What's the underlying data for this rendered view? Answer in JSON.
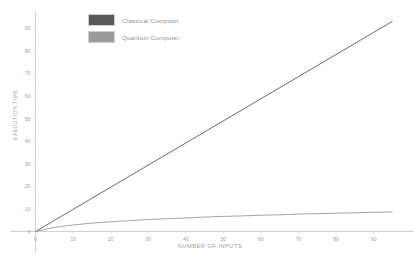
{
  "chart_data": {
    "type": "line",
    "title": "",
    "subtitle": "",
    "xlabel": "NUMBER OF INPUTS",
    "ylabel": "EXECUTION TIME",
    "xlim": [
      0,
      97
    ],
    "ylim": [
      0,
      95
    ],
    "xticks": [
      0,
      10,
      20,
      30,
      40,
      50,
      60,
      70,
      80,
      90
    ],
    "yticks": [
      0,
      10,
      20,
      30,
      40,
      50,
      60,
      70,
      80,
      90
    ],
    "grid": false,
    "legend_position": "top-left-inside",
    "series": [
      {
        "name": "Classical Computer",
        "color": "#595959",
        "x": [
          0,
          5,
          10,
          15,
          20,
          25,
          30,
          35,
          40,
          45,
          50,
          55,
          60,
          65,
          70,
          75,
          80,
          85,
          90,
          95
        ],
        "values": [
          0,
          4.9,
          9.8,
          14.7,
          19.6,
          24.5,
          29.4,
          34.3,
          39.2,
          44.1,
          49,
          53.9,
          58.8,
          63.7,
          68.6,
          73.5,
          78.4,
          83.3,
          88.2,
          93.1
        ]
      },
      {
        "name": "Quantum Computer",
        "color": "#9b9b9b",
        "x": [
          0,
          5,
          10,
          15,
          20,
          25,
          30,
          35,
          40,
          45,
          50,
          55,
          60,
          65,
          70,
          75,
          80,
          85,
          90,
          95
        ],
        "values": [
          0,
          1.8,
          2.9,
          3.7,
          4.3,
          4.8,
          5.3,
          5.7,
          6.0,
          6.4,
          6.7,
          6.9,
          7.2,
          7.4,
          7.7,
          7.9,
          8.1,
          8.3,
          8.5,
          8.7
        ]
      }
    ]
  },
  "legend": {
    "entries": [
      {
        "label": "Classical Computer",
        "color": "#595959"
      },
      {
        "label": "Quantum Computer",
        "color": "#9b9b9b"
      }
    ]
  },
  "axes": {
    "x_title": "NUMBER OF INPUTS",
    "y_title": "EXECUTION TIME",
    "x_tick_labels": [
      "0",
      "10",
      "20",
      "30",
      "40",
      "50",
      "60",
      "70",
      "80",
      "90"
    ],
    "y_tick_labels": [
      "0",
      "10",
      "20",
      "30",
      "40",
      "50",
      "60",
      "70",
      "80",
      "90"
    ]
  },
  "colors": {
    "axis": "#c2c2c2",
    "classical": "#595959",
    "quantum": "#9b9b9b",
    "text": "#9d9d9d",
    "background": "#ffffff"
  }
}
